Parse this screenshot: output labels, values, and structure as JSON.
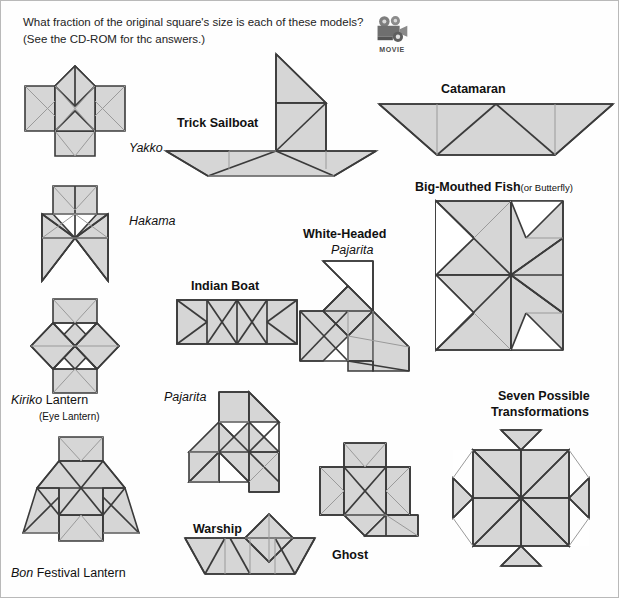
{
  "header": {
    "line1": "What fraction of the original square's size is each of these models?",
    "line2": "(See the CD-ROM for thc answers.)"
  },
  "movie_badge": {
    "icon": "movie-camera-icon",
    "caption": "MOVIE"
  },
  "colors": {
    "fill": "#d6d6d6",
    "outline": "#3b3b3b",
    "fold": "#9a9a9a",
    "white_fill": "#ffffff",
    "text": "#111111",
    "page_border": "#b9b9b9"
  },
  "figures": [
    {
      "id": "yakko",
      "label": "Yakko",
      "label_style": "italic",
      "label_x": 128,
      "label_y": 140
    },
    {
      "id": "hakama",
      "label": "Hakama",
      "label_style": "italic",
      "label_x": 128,
      "label_y": 213
    },
    {
      "id": "kiriko-lantern",
      "label_em": "Kiriko",
      "label": " Lantern",
      "sublabel": "(Eye Lantern)",
      "label_x": 10,
      "label_y": 392
    },
    {
      "id": "bon-lantern",
      "label_em": "Bon",
      "label": " Festival Lantern",
      "label_x": 10,
      "label_y": 565
    },
    {
      "id": "trick-sailboat",
      "label": "Trick Sailboat",
      "label_style": "bold",
      "label_x": 176,
      "label_y": 115
    },
    {
      "id": "indian-boat",
      "label": "Indian Boat",
      "label_style": "bold",
      "label_x": 190,
      "label_y": 278
    },
    {
      "id": "pajarita",
      "label": "Pajarita",
      "label_style": "italic",
      "label_x": 163,
      "label_y": 389
    },
    {
      "id": "warship",
      "label": "Warship",
      "label_style": "bold",
      "label_x": 192,
      "label_y": 521
    },
    {
      "id": "catamaran",
      "label": "Catamaran",
      "label_style": "bold",
      "label_x": 440,
      "label_y": 81
    },
    {
      "id": "big-mouthed-fish",
      "label": "Big-Mouthed Fish",
      "label_paren": "(or Butterfly)",
      "label_style": "bold",
      "label_x": 414,
      "label_y": 179
    },
    {
      "id": "white-headed-pajarita",
      "label": "White-Headed",
      "label2": "Pajarita",
      "label_style": "bold",
      "label_x": 302,
      "label_y": 226
    },
    {
      "id": "ghost",
      "label": "Ghost",
      "label_style": "bold",
      "label_x": 331,
      "label_y": 547
    },
    {
      "id": "seven-transformations",
      "label": "Seven Possible",
      "label2": "Transformations",
      "label_style": "bold",
      "label_x": 497,
      "label_y": 388
    }
  ]
}
